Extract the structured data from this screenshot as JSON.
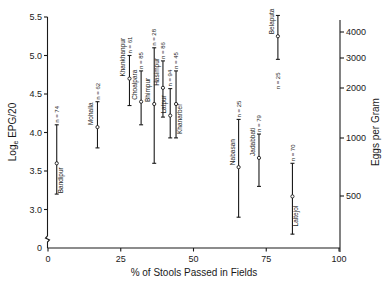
{
  "chart_data": {
    "type": "scatter",
    "subtype": "error-bar",
    "title": "",
    "xlabel": "% of Stools Passed in Fields",
    "ylabel": "Loge EPG/20",
    "ylabel_main": "Log",
    "ylabel_sub": "e",
    "ylabel_rest": " EPG/20",
    "y2label": "Eggs per Gram",
    "xlim": [
      0,
      100
    ],
    "ylim": [
      2.5,
      5.5
    ],
    "y_axis_break": true,
    "grid": false,
    "legend": "none",
    "x_ticks": [
      {
        "value": 0,
        "label": "0"
      },
      {
        "value": 25,
        "label": "25"
      },
      {
        "value": 50,
        "label": "50"
      },
      {
        "value": 75,
        "label": "75"
      },
      {
        "value": 100,
        "label": "100"
      }
    ],
    "y_ticks": [
      {
        "value": 5.5,
        "label": "5.5"
      },
      {
        "value": 5.0,
        "label": "5.0"
      },
      {
        "value": 4.5,
        "label": "4.5"
      },
      {
        "value": 4.0,
        "label": "4.0"
      },
      {
        "value": 3.5,
        "label": "3.5"
      },
      {
        "value": 3.0,
        "label": "3.0"
      }
    ],
    "y_zero_label": "0",
    "y2_ticks": [
      {
        "label": "4000",
        "y_px": 32
      },
      {
        "label": "3000",
        "y_px": 58
      },
      {
        "label": "2000",
        "y_px": 88
      },
      {
        "label": "1000",
        "y_px": 138
      },
      {
        "label": "500",
        "y_px": 196
      }
    ],
    "series": [
      {
        "name": "Bandipur",
        "x": 3,
        "mean": 3.6,
        "upper": 4.1,
        "lower": 3.2,
        "n": "n = 74",
        "label_side": "right",
        "n_pos": "top"
      },
      {
        "name": "Mohalla",
        "x": 17,
        "mean": 4.07,
        "upper": 4.4,
        "lower": 3.8,
        "n": "n = 62",
        "label_side": "left",
        "n_pos": "top"
      },
      {
        "name": "Khankhanpur",
        "x": 28,
        "mean": 4.7,
        "upper": 5.0,
        "lower": 4.35,
        "n": "n = 61",
        "label_side": "left",
        "n_pos": "top"
      },
      {
        "name": "Choalpara",
        "x": 32,
        "mean": 4.4,
        "upper": 4.8,
        "lower": 4.1,
        "n": "n = 85",
        "label_side": "left",
        "n_pos": "top"
      },
      {
        "name": "Bhimpur",
        "x": 36.5,
        "mean": 4.37,
        "upper": 5.1,
        "lower": 3.6,
        "n": "n = 28",
        "label_side": "left",
        "n_pos": "top"
      },
      {
        "name": "Hasimpur",
        "x": 39.5,
        "mean": 4.58,
        "upper": 4.93,
        "lower": 4.2,
        "n": "n = 86",
        "label_side": "left",
        "n_pos": "top"
      },
      {
        "name": "Latpur",
        "x": 42,
        "mean": 4.22,
        "upper": 4.57,
        "lower": 3.93,
        "n": "n = 94",
        "label_side": "left",
        "n_pos": "top"
      },
      {
        "name": "Khanarber",
        "x": 44,
        "mean": 4.37,
        "upper": 4.8,
        "lower": 3.93,
        "n": "n = 45",
        "label_side": "right",
        "n_pos": "top"
      },
      {
        "name": "Nabasan",
        "x": 65.5,
        "mean": 3.55,
        "upper": 4.17,
        "lower": 2.9,
        "n": "n = 25",
        "label_side": "left",
        "n_pos": "top"
      },
      {
        "name": "Jadabbati",
        "x": 72.5,
        "mean": 3.67,
        "upper": 3.98,
        "lower": 3.3,
        "n": "n = 79",
        "label_side": "left",
        "n_pos": "top"
      },
      {
        "name": "Belaputa",
        "x": 79,
        "mean": 5.25,
        "upper": 5.52,
        "lower": 4.95,
        "n": "n = 25",
        "label_side": "left",
        "n_pos": "bottom"
      },
      {
        "name": "Laltejol",
        "x": 84,
        "mean": 3.17,
        "upper": 3.6,
        "lower": 2.68,
        "n": "n = 70",
        "label_side": "right",
        "n_pos": "top"
      }
    ]
  }
}
